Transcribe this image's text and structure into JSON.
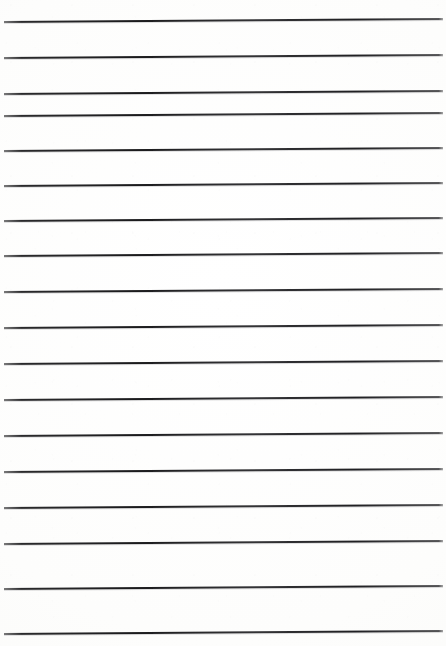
{
  "document": {
    "kind": "scanned-lined-paper",
    "title": "Blank Ruled Notebook Page",
    "width_px": 446,
    "height_px": 646,
    "background_color": "#fefefe",
    "paper_tint": "#fdfdfc",
    "text_content": "",
    "handwriting_present": "no",
    "printed_text_present": "no"
  },
  "ruling": {
    "line_color": "#1a1a1c",
    "line_thickness_px": 2,
    "line_count": 18,
    "spacing_px": 36,
    "first_line_y_px": 21,
    "last_line_y_px": 633,
    "left_margin_px": 4,
    "right_margin_px": 443,
    "skew_px": -3,
    "skew_note": "lines tilt slightly upward toward the right edge",
    "lines": [
      {
        "index": 1,
        "y": 21,
        "x_start": 4,
        "x_end": 443
      },
      {
        "index": 2,
        "y": 57,
        "x_start": 4,
        "x_end": 443
      },
      {
        "index": 3,
        "y": 93,
        "x_start": 4,
        "x_end": 443
      },
      {
        "index": 4,
        "y": 115,
        "x_start": 4,
        "x_end": 443
      },
      {
        "index": 5,
        "y": 150,
        "x_start": 4,
        "x_end": 443
      },
      {
        "index": 6,
        "y": 185,
        "x_start": 4,
        "x_end": 443
      },
      {
        "index": 7,
        "y": 220,
        "x_start": 4,
        "x_end": 443
      },
      {
        "index": 8,
        "y": 255,
        "x_start": 4,
        "x_end": 443
      },
      {
        "index": 9,
        "y": 291,
        "x_start": 4,
        "x_end": 443
      },
      {
        "index": 10,
        "y": 327,
        "x_start": 4,
        "x_end": 443
      },
      {
        "index": 11,
        "y": 363,
        "x_start": 4,
        "x_end": 443
      },
      {
        "index": 12,
        "y": 399,
        "x_start": 4,
        "x_end": 443
      },
      {
        "index": 13,
        "y": 435,
        "x_start": 4,
        "x_end": 443
      },
      {
        "index": 14,
        "y": 471,
        "x_start": 4,
        "x_end": 443
      },
      {
        "index": 15,
        "y": 507,
        "x_start": 4,
        "x_end": 443
      },
      {
        "index": 16,
        "y": 543,
        "x_start": 4,
        "x_end": 443
      },
      {
        "index": 17,
        "y": 588,
        "x_start": 4,
        "x_end": 443
      },
      {
        "index": 18,
        "y": 633,
        "x_start": 4,
        "x_end": 443
      }
    ]
  }
}
